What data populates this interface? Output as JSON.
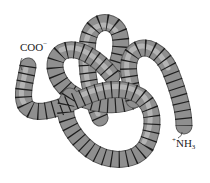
{
  "figure": {
    "type": "protein-tertiary-structure",
    "colors": {
      "background": "#ffffff",
      "tube": "#8f8f8f",
      "tube_outline": "#5a5a5a",
      "tube_highlight": "#b4b4b4",
      "segment_lines": "#1e1e1e",
      "label_text": "#222222"
    }
  },
  "labels": {
    "c_terminus": {
      "base": "COO",
      "superscript": "−"
    },
    "n_terminus": {
      "prefix_superscript": "+",
      "base": "NH",
      "subscript": "3"
    }
  }
}
